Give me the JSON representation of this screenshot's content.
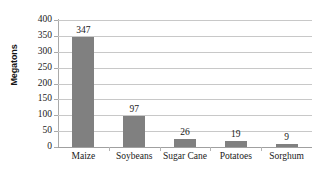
{
  "chart_data": {
    "type": "bar",
    "title": "",
    "xlabel": "",
    "ylabel": "Megatons",
    "categories": [
      "Maize",
      "Soybeans",
      "Sugar Cane",
      "Potatoes",
      "Sorghum"
    ],
    "values": [
      347,
      97,
      26,
      19,
      9
    ],
    "value_labels": [
      "347",
      "97",
      "26",
      "19",
      "9"
    ],
    "ylim": [
      0,
      400
    ],
    "ytick_values": [
      0,
      50,
      100,
      150,
      200,
      250,
      300,
      350,
      400
    ],
    "ytick_labels": [
      "0",
      "50",
      "100",
      "150",
      "200",
      "250",
      "300",
      "350",
      "400"
    ],
    "grid": "horizontal",
    "legend": "none",
    "series": [
      {
        "name": "Megatons",
        "values": [
          347,
          97,
          26,
          19,
          9
        ],
        "color": "#808080"
      }
    ],
    "colors": {
      "bar": "#808080",
      "gridline": "#c8c8c8",
      "axis": "#a9a9a9",
      "text": "#1a1a1a",
      "background": "#ffffff"
    }
  }
}
